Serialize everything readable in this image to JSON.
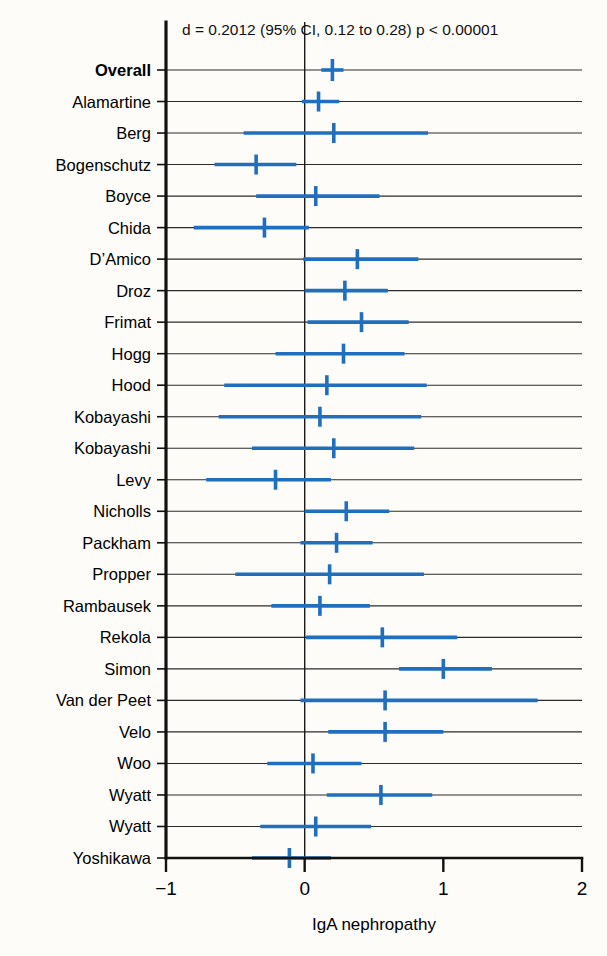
{
  "figure": {
    "title": "d = 0.2012 (95% CI, 0.12 to 0.28) p < 0.00001",
    "axis_title": "IgA nephropathy",
    "accent_color": "#1f6fbe",
    "axis_color": "#111111",
    "grid_color": "#2b2b2b",
    "background": "#fdfcf9"
  },
  "chart_data": {
    "type": "forest",
    "title": "d = 0.2012 (95% CI, 0.12 to 0.28) p < 0.00001",
    "xlabel": "IgA nephropathy",
    "ylabel": "",
    "xlim": [
      -1,
      2
    ],
    "xticks": [
      -1,
      0,
      1,
      2
    ],
    "xticklabels": [
      "−1",
      "0",
      "1",
      "2"
    ],
    "grid": true,
    "legend": "none",
    "reference_line": 0,
    "effect_measure": "d",
    "summary": {
      "label": "Overall",
      "effect": 0.2012,
      "ci_low": 0.12,
      "ci_high": 0.28,
      "p_value": "p < 0.00001",
      "is_summary": true
    },
    "categories": [
      "Overall",
      "Alamartine",
      "Berg",
      "Bogenschutz",
      "Boyce",
      "Chida",
      "D’Amico",
      "Droz",
      "Frimat",
      "Hogg",
      "Hood",
      "Kobayashi",
      "Kobayashi",
      "Levy",
      "Nicholls",
      "Packham",
      "Propper",
      "Rambausek",
      "Rekola",
      "Simon",
      "Van der Peet",
      "Velo",
      "Woo",
      "Wyatt",
      "Wyatt",
      "Yoshikawa"
    ],
    "rows": [
      {
        "label": "Overall",
        "effect": 0.2,
        "ci_low": 0.12,
        "ci_high": 0.28,
        "is_summary": true
      },
      {
        "label": "Alamartine",
        "effect": 0.1,
        "ci_low": -0.02,
        "ci_high": 0.25,
        "is_summary": false
      },
      {
        "label": "Berg",
        "effect": 0.21,
        "ci_low": -0.44,
        "ci_high": 0.89,
        "is_summary": false
      },
      {
        "label": "Bogenschutz",
        "effect": -0.35,
        "ci_low": -0.65,
        "ci_high": -0.06,
        "is_summary": false
      },
      {
        "label": "Boyce",
        "effect": 0.08,
        "ci_low": -0.35,
        "ci_high": 0.54,
        "is_summary": false
      },
      {
        "label": "Chida",
        "effect": -0.29,
        "ci_low": -0.8,
        "ci_high": 0.03,
        "is_summary": false
      },
      {
        "label": "D’Amico",
        "effect": 0.38,
        "ci_low": -0.01,
        "ci_high": 0.82,
        "is_summary": false
      },
      {
        "label": "Droz",
        "effect": 0.29,
        "ci_low": 0.0,
        "ci_high": 0.6,
        "is_summary": false
      },
      {
        "label": "Frimat",
        "effect": 0.41,
        "ci_low": 0.02,
        "ci_high": 0.75,
        "is_summary": false
      },
      {
        "label": "Hogg",
        "effect": 0.28,
        "ci_low": -0.21,
        "ci_high": 0.72,
        "is_summary": false
      },
      {
        "label": "Hood",
        "effect": 0.16,
        "ci_low": -0.58,
        "ci_high": 0.88,
        "is_summary": false
      },
      {
        "label": "Kobayashi",
        "effect": 0.11,
        "ci_low": -0.62,
        "ci_high": 0.84,
        "is_summary": false
      },
      {
        "label": "Kobayashi",
        "effect": 0.21,
        "ci_low": -0.38,
        "ci_high": 0.79,
        "is_summary": false
      },
      {
        "label": "Levy",
        "effect": -0.21,
        "ci_low": -0.71,
        "ci_high": 0.19,
        "is_summary": false
      },
      {
        "label": "Nicholls",
        "effect": 0.3,
        "ci_low": 0.0,
        "ci_high": 0.61,
        "is_summary": false
      },
      {
        "label": "Packham",
        "effect": 0.23,
        "ci_low": -0.03,
        "ci_high": 0.49,
        "is_summary": false
      },
      {
        "label": "Propper",
        "effect": 0.18,
        "ci_low": -0.5,
        "ci_high": 0.86,
        "is_summary": false
      },
      {
        "label": "Rambausek",
        "effect": 0.11,
        "ci_low": -0.24,
        "ci_high": 0.47,
        "is_summary": false
      },
      {
        "label": "Rekola",
        "effect": 0.56,
        "ci_low": 0.01,
        "ci_high": 1.1,
        "is_summary": false
      },
      {
        "label": "Simon",
        "effect": 1.0,
        "ci_low": 0.68,
        "ci_high": 1.35,
        "is_summary": false
      },
      {
        "label": "Van der Peet",
        "effect": 0.58,
        "ci_low": -0.03,
        "ci_high": 1.68,
        "is_summary": false
      },
      {
        "label": "Velo",
        "effect": 0.58,
        "ci_low": 0.17,
        "ci_high": 1.0,
        "is_summary": false
      },
      {
        "label": "Woo",
        "effect": 0.06,
        "ci_low": -0.27,
        "ci_high": 0.41,
        "is_summary": false
      },
      {
        "label": "Wyatt",
        "effect": 0.55,
        "ci_low": 0.16,
        "ci_high": 0.92,
        "is_summary": false
      },
      {
        "label": "Wyatt",
        "effect": 0.08,
        "ci_low": -0.32,
        "ci_high": 0.48,
        "is_summary": false
      },
      {
        "label": "Yoshikawa",
        "effect": -0.11,
        "ci_low": -0.38,
        "ci_high": 0.19,
        "is_summary": false
      }
    ]
  }
}
